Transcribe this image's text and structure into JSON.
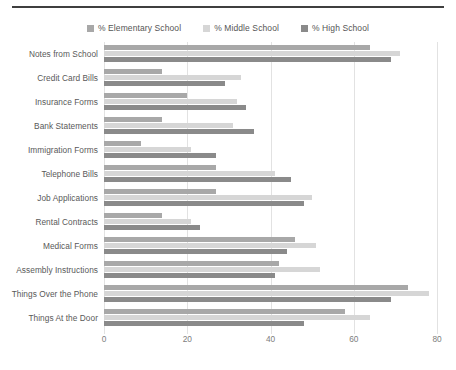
{
  "chart_data": {
    "type": "bar",
    "orientation": "horizontal",
    "title": "",
    "subtitle": "",
    "xlabel": "",
    "ylabel": "",
    "xlim": [
      0,
      80
    ],
    "xticks": [
      0,
      20,
      40,
      60,
      80
    ],
    "xtick_labels": [
      "0",
      "20",
      "40",
      "60",
      "80"
    ],
    "grid": true,
    "legend_position": "top-center",
    "categories": [
      "Notes from School",
      "Credit Card Bills",
      "Insurance Forms",
      "Bank Statements",
      "Immigration Forms",
      "Telephone Bills",
      "Job Applications",
      "Rental Contracts",
      "Medical Forms",
      "Assembly Instructions",
      "Things Over the Phone",
      "Things At the Door"
    ],
    "series": [
      {
        "name": "% Elementary School",
        "color": "#a8a8a8",
        "values": [
          64,
          14,
          20,
          14,
          9,
          27,
          27,
          14,
          46,
          42,
          73,
          58
        ]
      },
      {
        "name": "% Middle School",
        "color": "#d6d6d6",
        "values": [
          71,
          33,
          32,
          31,
          21,
          41,
          50,
          21,
          51,
          52,
          78,
          64
        ]
      },
      {
        "name": "% High School",
        "color": "#8a8a8a",
        "values": [
          69,
          29,
          34,
          36,
          27,
          45,
          48,
          23,
          44,
          41,
          69,
          48
        ]
      }
    ]
  },
  "legend": {
    "items": [
      {
        "label": "% Elementary School",
        "color": "#a8a8a8"
      },
      {
        "label": "% Middle School",
        "color": "#d6d6d6"
      },
      {
        "label": "% High School",
        "color": "#8a8a8a"
      }
    ]
  },
  "colors": {
    "elementary": "#a8a8a8",
    "middle": "#d6d6d6",
    "high": "#8a8a8a",
    "gridline": "#e2e2e2",
    "rule": "#3f3f3f",
    "text": "#595959"
  }
}
